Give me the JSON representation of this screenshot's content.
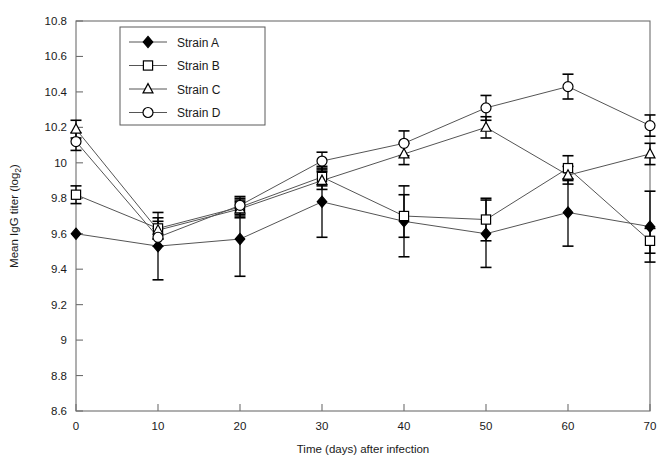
{
  "chart_data": {
    "type": "line",
    "title": "",
    "xlabel": "Time (days) after infection",
    "ylabel": "Mean IgG titer (log2)",
    "ylabel_main": "Mean IgG titer (log",
    "ylabel_sub": "2",
    "ylabel_close": ")",
    "x": [
      0,
      10,
      20,
      30,
      40,
      50,
      60,
      70
    ],
    "xlim": [
      0,
      70
    ],
    "ylim": [
      8.6,
      10.8
    ],
    "xticks": [
      0,
      10,
      20,
      30,
      40,
      50,
      60,
      70
    ],
    "xtick_labels": [
      "0",
      "10",
      "20",
      "30",
      "40",
      "50",
      "60",
      "70"
    ],
    "yticks": [
      8.6,
      8.8,
      9.0,
      9.2,
      9.4,
      9.6,
      9.8,
      10.0,
      10.2,
      10.4,
      10.6,
      10.8
    ],
    "ytick_labels": [
      "8.6",
      "8.8",
      "9",
      "9.2",
      "9.4",
      "9.6",
      "9.8",
      "10",
      "10.2",
      "10.4",
      "10.6",
      "10.8"
    ],
    "grid": false,
    "legend_position": "top-center-left",
    "error_bars": true,
    "series": [
      {
        "name": "Strain A",
        "marker": "filled-diamond",
        "values": [
          9.6,
          9.53,
          9.57,
          9.78,
          9.67,
          9.6,
          9.72,
          9.64
        ],
        "errors": [
          0.0,
          0.19,
          0.21,
          0.2,
          0.2,
          0.19,
          0.19,
          0.2
        ]
      },
      {
        "name": "Strain B",
        "marker": "open-square",
        "values": [
          9.82,
          9.63,
          9.75,
          9.92,
          9.7,
          9.68,
          9.97,
          9.56
        ],
        "errors": [
          0.05,
          0.06,
          0.05,
          0.05,
          0.12,
          0.12,
          0.07,
          0.07
        ]
      },
      {
        "name": "Strain C",
        "marker": "open-triangle",
        "values": [
          10.19,
          9.62,
          9.74,
          9.9,
          10.05,
          10.2,
          9.93,
          10.05
        ],
        "errors": [
          0.05,
          0.05,
          0.05,
          0.05,
          0.06,
          0.06,
          0.05,
          0.06
        ]
      },
      {
        "name": "Strain D",
        "marker": "open-circle",
        "values": [
          10.12,
          9.58,
          9.76,
          10.01,
          10.11,
          10.31,
          10.43,
          10.21
        ]
      }
    ],
    "series_d_errors": [
      0.05,
      0.05,
      0.05,
      0.05,
      0.07,
      0.07,
      0.07,
      0.06
    ]
  },
  "legend": {
    "items": [
      {
        "label": "Strain A"
      },
      {
        "label": "Strain B"
      },
      {
        "label": "Strain C"
      },
      {
        "label": "Strain D"
      }
    ]
  },
  "colors": {
    "line": "#555555",
    "marker_stroke": "#000000",
    "marker_fill": "#ffffff",
    "marker_fill_solid": "#000000",
    "axis": "#6e6e6e",
    "error_bar": "#000000",
    "text": "#1a1a1a",
    "background": "#ffffff"
  }
}
